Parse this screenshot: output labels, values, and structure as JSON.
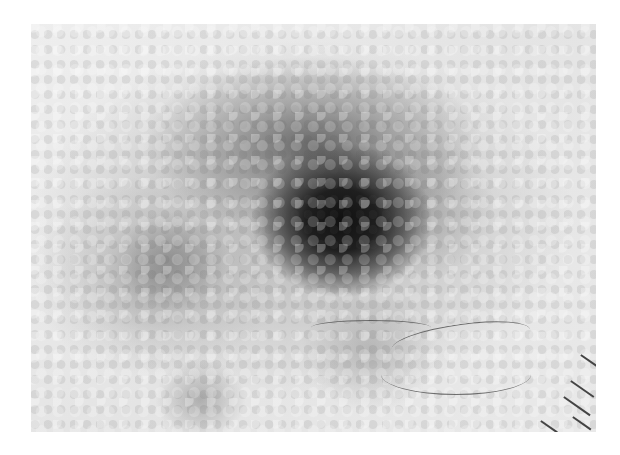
{
  "image": {
    "type": "dermoscopy-grayscale",
    "description": "Grayscale dermoscopic image of a pigmented skin lesion with a dark central blotch, reticular/globular pattern, a few hairs, and scale marks at lower right",
    "colors": {
      "background": "#ffffff",
      "skin": "#e9e9e9",
      "blotch": "#111111",
      "network": "#8a8a8a"
    }
  }
}
